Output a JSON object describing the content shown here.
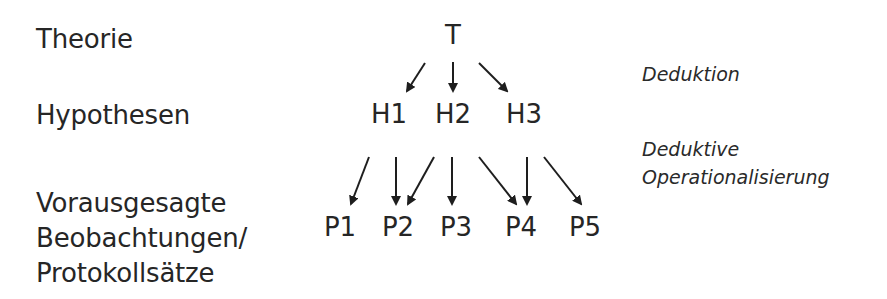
{
  "levels": {
    "theory_label": "Theorie",
    "hypotheses_label": "Hypothesen",
    "observations_label_line1": "Vorausgesagte",
    "observations_label_line2": "Beobachtungen/",
    "observations_label_line3": "Protokollsätze"
  },
  "nodes": {
    "theory": "T",
    "hypotheses": [
      "H1",
      "H2",
      "H3"
    ],
    "predictions": [
      "P1",
      "P2",
      "P3",
      "P4",
      "P5"
    ]
  },
  "annotations": {
    "deduction": "Deduktion",
    "operationalization_line1": "Deduktive",
    "operationalization_line2": "Operationalisierung"
  },
  "edges": [
    {
      "from": "T",
      "to": "H1"
    },
    {
      "from": "T",
      "to": "H2"
    },
    {
      "from": "T",
      "to": "H3"
    },
    {
      "from": "H1",
      "to": "P1"
    },
    {
      "from": "H1",
      "to": "P2"
    },
    {
      "from": "H2",
      "to": "P2"
    },
    {
      "from": "H2",
      "to": "P3"
    },
    {
      "from": "H2",
      "to": "P4"
    },
    {
      "from": "H3",
      "to": "P4"
    },
    {
      "from": "H3",
      "to": "P5"
    }
  ],
  "colors": {
    "text": "#262626",
    "arrows": "#1e1e1e",
    "background": "#ffffff"
  }
}
